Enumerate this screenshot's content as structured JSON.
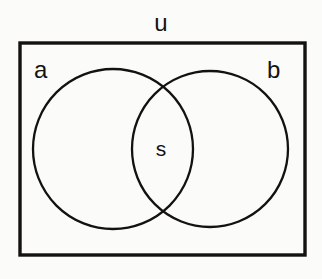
{
  "figure": {
    "kind": "venn-diagram",
    "background_color": "#fbfbfa",
    "stroke_color": "#14120f",
    "fill_color": "none"
  },
  "labels": {
    "universe": "u",
    "set_a": "a",
    "set_b": "b",
    "intersection": "s"
  },
  "geometry": {
    "rectangle": {
      "x": 20,
      "y": 43,
      "width": 285,
      "height": 212,
      "stroke_width": 3.4
    },
    "circle_a": {
      "cx": 113,
      "cy": 149,
      "r": 80,
      "stroke_width": 2.3
    },
    "circle_b": {
      "cx": 210,
      "cy": 149,
      "r": 78,
      "stroke_width": 2.3
    }
  }
}
